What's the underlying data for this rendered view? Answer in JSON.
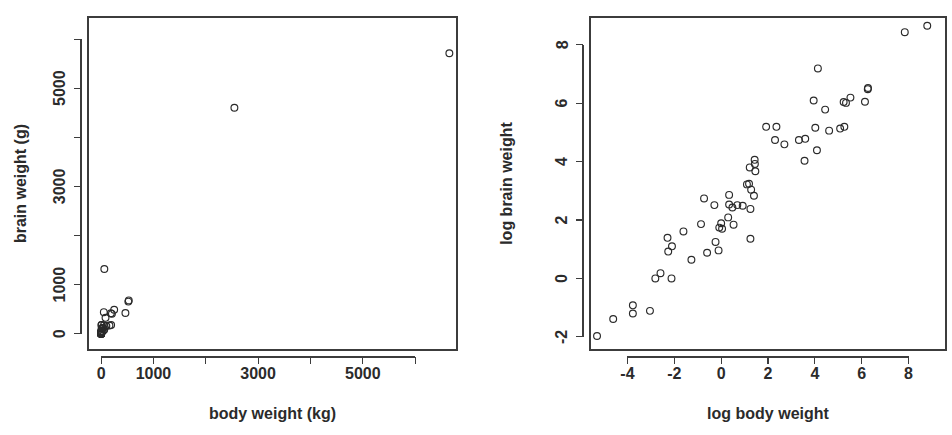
{
  "figure": {
    "background": "#ffffff",
    "point_color": "#2a2a2a",
    "axis_color": "#3c3c3c",
    "marker": "open-circle"
  },
  "chart_data": [
    {
      "type": "scatter",
      "panel": "left",
      "title": "",
      "xlabel": "body weight (kg)",
      "ylabel": "brain weight (g)",
      "xlim": [
        -250,
        6800
      ],
      "ylim": [
        -330,
        6450
      ],
      "xticks": [
        0,
        1000,
        2000,
        3000,
        4000,
        5000,
        6000
      ],
      "xticklabels": [
        "0",
        "1000",
        "",
        "3000",
        "",
        "5000",
        ""
      ],
      "yticks": [
        0,
        1000,
        2000,
        3000,
        4000,
        5000,
        6000
      ],
      "yticklabels": [
        "0",
        "1000",
        "",
        "3000",
        "",
        "5000",
        ""
      ],
      "grid": false,
      "legend": false,
      "x": [
        3.385,
        0.48,
        1.35,
        465,
        36.33,
        27.66,
        14.83,
        1.04,
        4.19,
        0.425,
        0.101,
        0.92,
        1,
        0.005,
        0.06,
        3.5,
        2,
        1.7,
        2547,
        0.023,
        187.1,
        521,
        0.785,
        10,
        3.3,
        0.2,
        1.41,
        529,
        207,
        85,
        0.75,
        62,
        6654,
        3.5,
        6.8,
        35,
        4.05,
        0.12,
        0.023,
        0.01,
        1.4,
        250,
        2.5,
        55.5,
        100,
        52.16,
        10.55,
        0.55,
        60,
        3.6,
        4.288,
        0.28,
        0.075,
        0.122,
        0.048,
        192,
        3,
        160,
        0.9,
        1.62,
        0.104,
        4.235
      ],
      "y": [
        44.5,
        15.5,
        8.1,
        423,
        119.5,
        115,
        98.2,
        5.5,
        58,
        6.4,
        4,
        5.7,
        6.6,
        0.14,
        1,
        10.8,
        12.3,
        6.3,
        4603,
        0.3,
        419,
        655,
        3.5,
        115,
        25.6,
        5,
        17.5,
        680,
        406,
        325,
        12.3,
        1320,
        5712,
        3.9,
        179,
        56,
        17,
        1,
        0.4,
        0.25,
        12.5,
        490,
        12.1,
        175,
        157,
        440,
        179.5,
        2.4,
        81,
        21,
        39.2,
        1.9,
        1.2,
        3,
        0.33,
        180,
        25,
        169,
        2.6,
        11.4,
        2.5,
        50.4
      ]
    },
    {
      "type": "scatter",
      "panel": "right",
      "title": "",
      "xlabel": "log body weight",
      "ylabel": "log brain weight",
      "xlim": [
        -5.6,
        9.6
      ],
      "ylim": [
        -2.45,
        8.95
      ],
      "xticks": [
        -4,
        -2,
        0,
        2,
        4,
        6,
        8
      ],
      "xticklabels": [
        "-4",
        "-2",
        "0",
        "2",
        "4",
        "6",
        "8"
      ],
      "yticks": [
        -2,
        0,
        2,
        4,
        6,
        8
      ],
      "yticklabels": [
        "-2",
        "0",
        "2",
        "4",
        "6",
        "8"
      ],
      "grid": false,
      "legend": false,
      "x": [
        1.22,
        -0.73,
        0.3,
        6.14,
        3.59,
        3.32,
        2.7,
        0.04,
        1.43,
        -0.86,
        -2.29,
        -0.08,
        0,
        -5.3,
        -2.81,
        1.25,
        0.69,
        0.53,
        7.84,
        -3.77,
        5.23,
        6.26,
        -0.24,
        2.3,
        1.19,
        -1.61,
        0.34,
        6.27,
        5.33,
        4.44,
        -0.29,
        4.13,
        8.8,
        1.25,
        1.92,
        3.56,
        1.4,
        -2.12,
        -3.77,
        -4.61,
        0.34,
        5.52,
        0.92,
        4.02,
        4.61,
        3.95,
        2.36,
        -0.6,
        4.09,
        1.28,
        1.46,
        -1.27,
        -2.59,
        -2.1,
        -3.04,
        5.26,
        1.1,
        5.08,
        -0.11,
        0.48,
        -2.26,
        1.44
      ],
      "y": [
        3.8,
        2.74,
        2.09,
        6.05,
        4.78,
        4.74,
        4.59,
        1.7,
        4.06,
        1.86,
        1.39,
        1.74,
        1.89,
        -1.97,
        0,
        2.38,
        2.51,
        1.84,
        8.43,
        -1.2,
        6.04,
        6.48,
        1.25,
        4.74,
        3.24,
        1.61,
        2.86,
        6.52,
        6.01,
        5.78,
        2.51,
        7.19,
        8.65,
        1.36,
        5.19,
        4.03,
        2.83,
        0,
        -0.92,
        -1.39,
        2.53,
        6.19,
        2.49,
        5.16,
        5.06,
        6.09,
        5.19,
        0.88,
        4.39,
        3.04,
        3.67,
        0.64,
        0.18,
        1.1,
        -1.11,
        5.19,
        3.22,
        5.13,
        0.96,
        2.43,
        0.92,
        3.92
      ]
    }
  ]
}
